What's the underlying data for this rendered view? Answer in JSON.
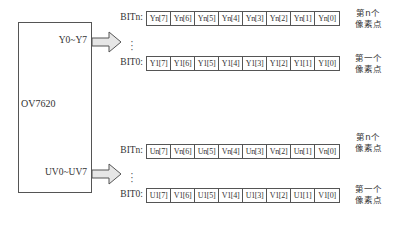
{
  "chip": {
    "name": "OV7620",
    "ports": [
      {
        "label": "Y0~Y7"
      },
      {
        "label": "UV0~UV7"
      }
    ]
  },
  "groups": [
    {
      "port": "Y0~Y7",
      "rows": [
        {
          "bit_label": "BITn:",
          "cells": [
            "Yn[7]",
            "Yn[6]",
            "Yn[5]",
            "Yn[4]",
            "Yn[3]",
            "Yn[2]",
            "Yn[1]",
            "Yn[0]"
          ],
          "pixel_label_line1": "第n个",
          "pixel_label_line2": "像素点"
        },
        {
          "bit_label": "BIT0:",
          "cells": [
            "Y1[7]",
            "Y1[6]",
            "Y1[5]",
            "Y1[4]",
            "Y1[3]",
            "Y1[2]",
            "Y1[1]",
            "Y1[0]"
          ],
          "pixel_label_line1": "第一个",
          "pixel_label_line2": "像素点"
        }
      ],
      "ellipsis": "⋮"
    },
    {
      "port": "UV0~UV7",
      "rows": [
        {
          "bit_label": "BITn:",
          "cells": [
            "Un[7]",
            "Vn[6]",
            "Un[5]",
            "Vn[4]",
            "Un[3]",
            "Vn[2]",
            "Un[1]",
            "Vn[0]"
          ],
          "pixel_label_line1": "第n个",
          "pixel_label_line2": "像素点"
        },
        {
          "bit_label": "BIT0:",
          "cells": [
            "U1[7]",
            "V1[6]",
            "U1[5]",
            "V1[4]",
            "U1[3]",
            "V1[2]",
            "U1[1]",
            "V1[0]"
          ],
          "pixel_label_line1": "第一个",
          "pixel_label_line2": "像素点"
        }
      ],
      "ellipsis": "⋮"
    }
  ],
  "colors": {
    "line": "#555555",
    "arrow_fill": "#e6e6e6",
    "text": "#333333"
  }
}
